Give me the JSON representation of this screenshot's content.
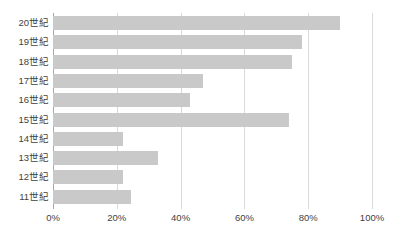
{
  "chart_data": {
    "type": "bar",
    "orientation": "horizontal",
    "title": "",
    "subtitle": "",
    "xlabel": "",
    "ylabel": "",
    "grid": true,
    "legend": false,
    "legend_position": "none",
    "xlim": [
      0,
      100
    ],
    "xticks": [
      0,
      20,
      40,
      60,
      80,
      100
    ],
    "xtick_labels": [
      "0%",
      "20%",
      "40%",
      "60%",
      "80%",
      "100%"
    ],
    "categories": [
      "20世紀",
      "19世紀",
      "18世紀",
      "17世紀",
      "16世紀",
      "15世紀",
      "14世紀",
      "13世紀",
      "12世紀",
      "11世紀"
    ],
    "values": [
      90,
      78,
      75,
      47,
      43,
      74,
      22,
      33,
      22,
      24.5
    ],
    "bar_color": "#c9c9c9",
    "gridline_color": "#d9d9d9",
    "axis_color": "#a8a8a8",
    "background_color": "#ffffff",
    "text_color": "#3f3f3f"
  }
}
